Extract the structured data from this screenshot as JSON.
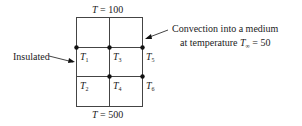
{
  "top_boundary": {
    "var": "T",
    "eq": " = 100"
  },
  "bottom_boundary": {
    "var": "T",
    "eq": " = 500"
  },
  "left_label": "Insulated",
  "right_label": {
    "line1": "Convection into a medium",
    "line2_prefix": "at temperature ",
    "var": "T",
    "sub": "∞",
    "eq": " = 50"
  },
  "nodes": [
    {
      "var": "T",
      "sub": "1"
    },
    {
      "var": "T",
      "sub": "2"
    },
    {
      "var": "T",
      "sub": "3"
    },
    {
      "var": "T",
      "sub": "4"
    },
    {
      "var": "T",
      "sub": "5"
    },
    {
      "var": "T",
      "sub": "6"
    }
  ]
}
